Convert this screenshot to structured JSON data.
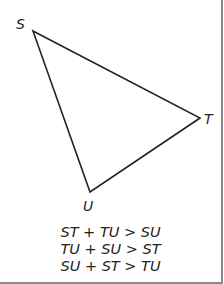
{
  "diagram": {
    "stroke_color": "#222222",
    "vertices": [
      {
        "name": "S",
        "x": 33,
        "y": 31
      },
      {
        "name": "T",
        "x": 200,
        "y": 118
      },
      {
        "name": "U",
        "x": 90,
        "y": 192
      }
    ],
    "labels": {
      "S": "S",
      "T": "T",
      "U": "U"
    },
    "inequalities": [
      "ST + TU > SU",
      "TU + SU > ST",
      "SU + ST > TU"
    ]
  }
}
